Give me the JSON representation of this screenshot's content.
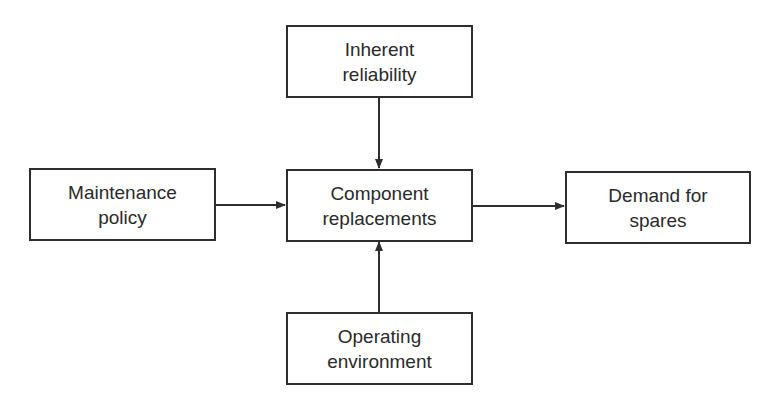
{
  "diagram": {
    "colors": {
      "stroke": "#2e2e2e",
      "text": "#2a2a2a",
      "background": "#ffffff"
    },
    "nodes": {
      "inherent_reliability": {
        "line1": "Inherent",
        "line2": "reliability"
      },
      "maintenance_policy": {
        "line1": "Maintenance",
        "line2": "policy"
      },
      "component_replacements": {
        "line1": "Component",
        "line2": "replacements"
      },
      "demand_for_spares": {
        "line1": "Demand for",
        "line2": "spares"
      },
      "operating_environment": {
        "line1": "Operating",
        "line2": "environment"
      }
    },
    "edges": [
      {
        "from": "Inherent reliability",
        "to": "Component replacements"
      },
      {
        "from": "Maintenance policy",
        "to": "Component replacements"
      },
      {
        "from": "Operating environment",
        "to": "Component replacements"
      },
      {
        "from": "Component replacements",
        "to": "Demand for spares"
      }
    ]
  }
}
